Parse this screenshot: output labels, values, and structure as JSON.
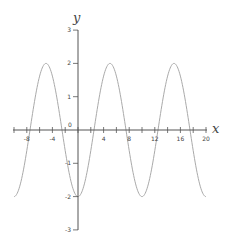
{
  "chart_data": {
    "type": "line",
    "title": "",
    "xlabel": "x",
    "ylabel": "y",
    "function": "y = -2cos(pi*x/5)",
    "xlim": [
      -10,
      20
    ],
    "ylim": [
      -3,
      3
    ],
    "x_ticks": [
      -8,
      -4,
      0,
      4,
      8,
      12,
      16,
      20
    ],
    "x_tick_labels": [
      "-8",
      "-4",
      "0",
      "4",
      "8",
      "12",
      "16",
      "20"
    ],
    "y_ticks": [
      -3,
      -2,
      -1,
      1,
      2,
      3
    ],
    "y_tick_labels": [
      "-3",
      "-2",
      "-1",
      "1",
      "2",
      "3"
    ],
    "origin_label": "0",
    "grid": false,
    "series": [
      {
        "name": "curve",
        "color": "#aaaaaa",
        "x": [
          -10,
          -7.5,
          -5,
          -2.5,
          0,
          2.5,
          5,
          7.5,
          10,
          12.5,
          15,
          17.5,
          20
        ],
        "y": [
          -2,
          0,
          2,
          0,
          -2,
          0,
          2,
          0,
          -2,
          0,
          2,
          0,
          -2
        ]
      }
    ]
  }
}
